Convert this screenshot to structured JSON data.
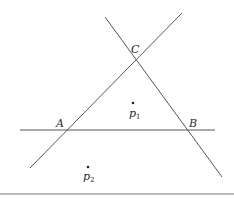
{
  "diagram": {
    "lines": [
      {
        "name": "line-AB",
        "x1": 20,
        "y1": 130,
        "x2": 215,
        "y2": 130
      },
      {
        "name": "line-AC",
        "x1": 30,
        "y1": 168,
        "x2": 182,
        "y2": 13
      },
      {
        "name": "line-BC",
        "x1": 105,
        "y1": 17,
        "x2": 222,
        "y2": 177
      }
    ],
    "vertices": {
      "A": {
        "label": "A",
        "x": 67,
        "y": 130
      },
      "B": {
        "label": "B",
        "x": 188,
        "y": 130
      },
      "C": {
        "label": "C",
        "x": 136,
        "y": 60
      }
    },
    "points": {
      "p1": {
        "label": "p",
        "sub": "1",
        "x": 133,
        "y": 103
      },
      "p2": {
        "label": "p",
        "sub": "2",
        "x": 88,
        "y": 167
      }
    },
    "colors": {
      "line": "#555555",
      "text": "#2a2a2a"
    }
  }
}
